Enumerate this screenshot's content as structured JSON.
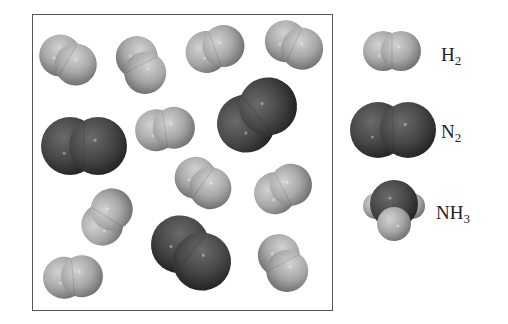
{
  "diagram": {
    "box": {
      "x": 32,
      "y": 14,
      "width": 299,
      "height": 295,
      "border_color": "#555555"
    },
    "colors": {
      "hydrogen": "#a8a8a8",
      "hydrogen_highlight": "#d2d2d2",
      "hydrogen_shadow": "#6e6e6e",
      "nitrogen": "#474747",
      "nitrogen_highlight": "#6a6a6a",
      "nitrogen_shadow": "#222222"
    },
    "molecules": [
      {
        "type": "H2",
        "cx": 68,
        "cy": 60,
        "angle": 30
      },
      {
        "type": "H2",
        "cx": 141,
        "cy": 65,
        "angle": 62
      },
      {
        "type": "H2",
        "cx": 215,
        "cy": 49,
        "angle": -20
      },
      {
        "type": "H2",
        "cx": 294,
        "cy": 45,
        "angle": 25
      },
      {
        "type": "N2",
        "cx": 84,
        "cy": 146,
        "angle": 0
      },
      {
        "type": "H2",
        "cx": 165,
        "cy": 129,
        "angle": -8
      },
      {
        "type": "N2",
        "cx": 257,
        "cy": 115,
        "angle": -38
      },
      {
        "type": "H2",
        "cx": 203,
        "cy": 183,
        "angle": 35
      },
      {
        "type": "H2",
        "cx": 283,
        "cy": 189,
        "angle": -28
      },
      {
        "type": "H2",
        "cx": 107,
        "cy": 217,
        "angle": -58
      },
      {
        "type": "N2",
        "cx": 191,
        "cy": 253,
        "angle": 38
      },
      {
        "type": "H2",
        "cx": 283,
        "cy": 263,
        "angle": 62
      },
      {
        "type": "H2",
        "cx": 73,
        "cy": 277,
        "angle": -5
      }
    ],
    "legend": [
      {
        "type": "H2",
        "cx": 392,
        "cy": 51,
        "label": "H",
        "subscript": "2",
        "label_x": 441,
        "label_y": 45
      },
      {
        "type": "N2",
        "cx": 393,
        "cy": 130,
        "label": "N",
        "subscript": "2",
        "label_x": 441,
        "label_y": 122
      },
      {
        "type": "NH3",
        "cx": 394,
        "cy": 210,
        "label": "NH",
        "subscript": "3",
        "label_x": 436,
        "label_y": 203
      }
    ]
  }
}
